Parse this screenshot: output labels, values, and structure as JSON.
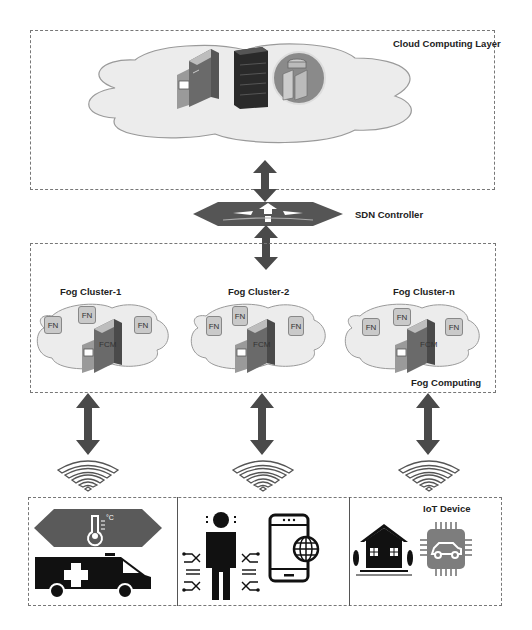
{
  "cloud_layer": {
    "label": "Cloud Computing Layer",
    "icons": [
      "server-tower-icon",
      "rack-server-icon",
      "database-server-icon"
    ]
  },
  "sdn": {
    "label": "SDN Controller",
    "icon": "router-switch-icon"
  },
  "fog_layer": {
    "label": "Fog Computing",
    "clusters": [
      {
        "title": "Fog Cluster-1",
        "nodes": [
          "FN",
          "FN",
          "FN"
        ],
        "manager": "FCM"
      },
      {
        "title": "Fog Cluster-2",
        "nodes": [
          "FN",
          "FN",
          "FN"
        ],
        "manager": "FCM"
      },
      {
        "title": "Fog Cluster-n",
        "nodes": [
          "FN",
          "FN",
          "FN"
        ],
        "manager": "FCM"
      }
    ]
  },
  "iot_layer": {
    "label": "IoT Device",
    "groups": [
      {
        "icons": [
          "thermometer-sensor-icon",
          "ambulance-icon"
        ]
      },
      {
        "icons": [
          "wearable-person-icon",
          "smartphone-globe-icon"
        ]
      },
      {
        "icons": [
          "smart-home-icon",
          "car-chip-icon"
        ]
      }
    ]
  },
  "colors": {
    "arrow": "#4a4a4a",
    "cloud_fill": "#e8e8e8",
    "cloud_stroke": "#999999",
    "box_border": "#777777",
    "fn_fill": "#c9c9c9"
  }
}
